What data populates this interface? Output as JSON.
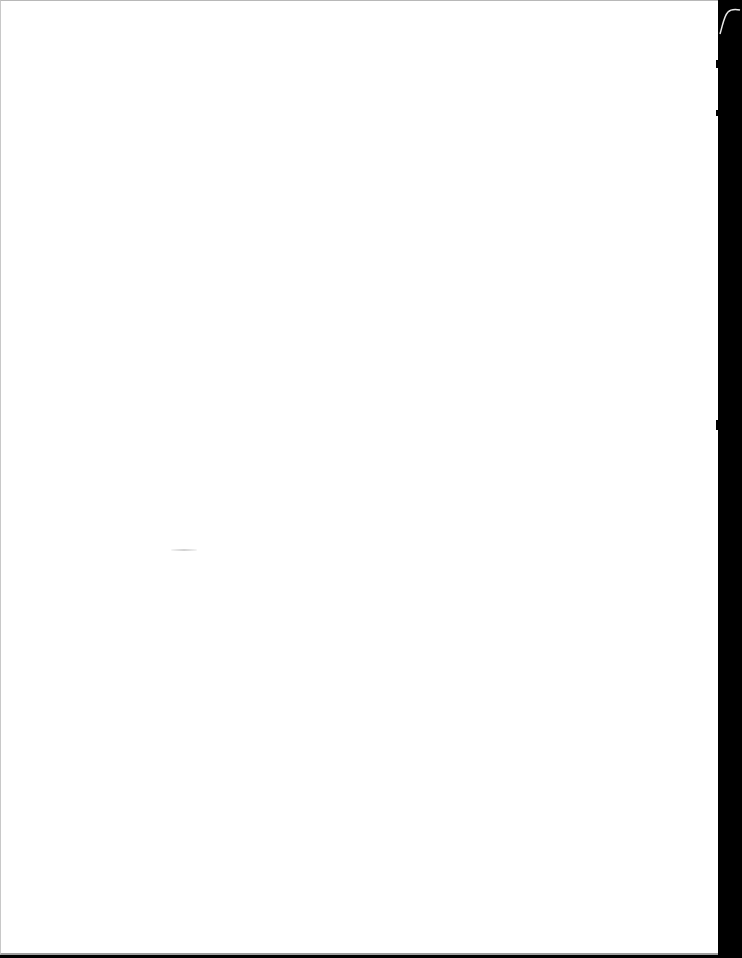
{
  "document": {
    "type": "scanned-page",
    "text": "",
    "colors": {
      "paper": "#ffffff",
      "scan_background": "#000000",
      "edge": "#b8b8b8",
      "smudge": "#c8c8c8"
    }
  }
}
